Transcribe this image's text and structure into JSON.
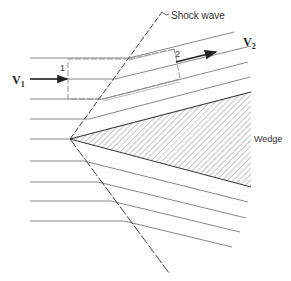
{
  "figure": {
    "labels": {
      "shock_wave": "Shock wave",
      "v1": "V",
      "v1_sub": "1",
      "v2": "V",
      "v2_sub": "2",
      "station1": "1",
      "station2": "2",
      "wedge": "Wedge"
    },
    "colors": {
      "line": "#7a7a7a",
      "shock": "#444444",
      "hatch": "#8a8a8a",
      "arrow": "#222222"
    }
  }
}
